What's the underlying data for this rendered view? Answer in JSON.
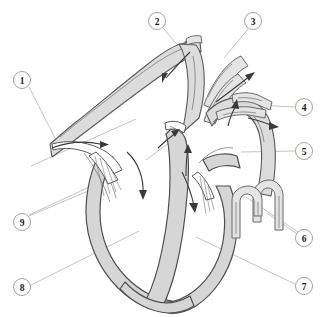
{
  "figure": {
    "type": "anatomical-line-diagram",
    "width": 321,
    "height": 317,
    "background_color": "#ffffff",
    "line_color": "#5a5a5a",
    "fill_color": "#dcdcdc",
    "callout_border_color": "#9a9a9a",
    "callout_text_color": "#1a1a1a",
    "arrow_color": "#3a3a3a"
  },
  "callouts": [
    {
      "id": "1",
      "label": "1",
      "cx": 22,
      "cy": 80,
      "r": 8.5
    },
    {
      "id": "2",
      "label": "2",
      "cx": 157,
      "cy": 21,
      "r": 8.5
    },
    {
      "id": "3",
      "label": "3",
      "cx": 253,
      "cy": 21,
      "r": 8.5
    },
    {
      "id": "4",
      "label": "4",
      "cx": 304,
      "cy": 107,
      "r": 8.5
    },
    {
      "id": "5",
      "label": "5",
      "cx": 304,
      "cy": 151,
      "r": 8.5
    },
    {
      "id": "6",
      "label": "6",
      "cx": 304,
      "cy": 238,
      "r": 8.5
    },
    {
      "id": "7",
      "label": "7",
      "cx": 304,
      "cy": 286,
      "r": 8.5
    },
    {
      "id": "8",
      "label": "8",
      "cx": 22,
      "cy": 287,
      "r": 8.5
    },
    {
      "id": "9",
      "label": "9",
      "cx": 22,
      "cy": 222,
      "r": 8.5
    }
  ],
  "flow_arrows": {
    "count": 8,
    "description": "blood flow direction arrows inside chambers and great vessels"
  }
}
